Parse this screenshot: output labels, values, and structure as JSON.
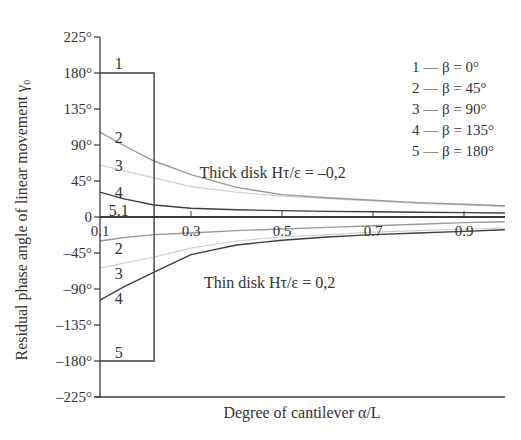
{
  "chart_data": {
    "type": "line",
    "title": "",
    "xlabel": "Degree of cantilever α/L",
    "ylabel": "Residual phase angle of linear movement γ₀",
    "xlim": [
      0.1,
      0.99
    ],
    "ylim": [
      -225,
      225
    ],
    "grid": false,
    "x_ticks": [
      {
        "value": 0.1,
        "label": "0.1"
      },
      {
        "value": 0.3,
        "label": "0.3"
      },
      {
        "value": 0.5,
        "label": "0.5"
      },
      {
        "value": 0.7,
        "label": "0.7"
      },
      {
        "value": 0.9,
        "label": "0.9"
      }
    ],
    "y_ticks": [
      {
        "value": 225,
        "label": "225°"
      },
      {
        "value": 180,
        "label": "180°"
      },
      {
        "value": 135,
        "label": "135°"
      },
      {
        "value": 90,
        "label": "90°"
      },
      {
        "value": 45,
        "label": "45°"
      },
      {
        "value": 0,
        "label": "0"
      },
      {
        "value": -45,
        "label": "–45°"
      },
      {
        "value": -90,
        "label": "–90°"
      },
      {
        "value": -135,
        "label": "–135°"
      },
      {
        "value": -180,
        "label": "–180°"
      },
      {
        "value": -225,
        "label": "–225°"
      }
    ],
    "legend": {
      "position": "top-right",
      "entries": [
        "1 — β = 0°",
        "2 — β = 45°",
        "3 — β = 90°",
        "4 — β = 135°",
        "5 — β = 180°"
      ]
    },
    "annotations": [
      {
        "text": "Thick disk Hτ/ε = –0,2",
        "x": 0.31,
        "y": 55
      },
      {
        "text": "Thin disk Hτ/ε = 0,2",
        "x": 0.32,
        "y": -82
      }
    ],
    "curve_labels": [
      {
        "text": "1",
        "x": 0.15,
        "y": 185
      },
      {
        "text": "2",
        "x": 0.15,
        "y": 93
      },
      {
        "text": "3",
        "x": 0.15,
        "y": 58
      },
      {
        "text": "4",
        "x": 0.15,
        "y": 24
      },
      {
        "text": "5.1",
        "x": 0.15,
        "y": 1
      },
      {
        "text": "2",
        "x": 0.15,
        "y": -46
      },
      {
        "text": "3",
        "x": 0.15,
        "y": -77
      },
      {
        "text": "4",
        "x": 0.15,
        "y": -109
      },
      {
        "text": "5",
        "x": 0.15,
        "y": -176
      }
    ],
    "series": [
      {
        "name": "Thick disk, β = 0°",
        "curve": 1,
        "color": "#3f3f3f",
        "x": [
          0.1,
          0.219,
          0.219,
          0.99
        ],
        "y": [
          180,
          180,
          0,
          0
        ]
      },
      {
        "name": "Thick disk, β = 45°",
        "curve": 2,
        "color": "#9a9a9a",
        "x": [
          0.1,
          0.15,
          0.219,
          0.3,
          0.4,
          0.5,
          0.6,
          0.7,
          0.8,
          0.9,
          0.99
        ],
        "y": [
          106,
          90,
          70,
          53,
          37,
          28,
          24,
          21,
          18,
          16,
          14
        ]
      },
      {
        "name": "Thick disk, β = 90°",
        "curve": 3,
        "color": "#d0d0d0",
        "x": [
          0.1,
          0.15,
          0.219,
          0.3,
          0.4,
          0.5,
          0.6,
          0.7,
          0.8,
          0.9,
          0.99
        ],
        "y": [
          65,
          58,
          49,
          38,
          31,
          26,
          23,
          20,
          17,
          15,
          13
        ]
      },
      {
        "name": "Thick disk, β = 135°",
        "curve": 4,
        "color": "#3f3f3f",
        "x": [
          0.1,
          0.15,
          0.219,
          0.3,
          0.4,
          0.5,
          0.6,
          0.7,
          0.8,
          0.9,
          0.99
        ],
        "y": [
          31,
          23,
          15,
          11,
          9,
          8,
          7,
          6.5,
          6,
          5.5,
          5
        ]
      },
      {
        "name": "Thick disk, β = 180°",
        "curve": 5,
        "color": "#3f3f3f",
        "x": [
          0.1,
          0.99
        ],
        "y": [
          0,
          0
        ]
      },
      {
        "name": "Thin disk, β = 0°",
        "curve": 1,
        "color": "#3f3f3f",
        "x": [
          0.1,
          0.99
        ],
        "y": [
          0,
          0
        ]
      },
      {
        "name": "Thin disk, β = 45°",
        "curve": 2,
        "color": "#9a9a9a",
        "x": [
          0.1,
          0.15,
          0.219,
          0.3,
          0.4,
          0.5,
          0.6,
          0.7,
          0.8,
          0.9,
          0.99
        ],
        "y": [
          -30,
          -26,
          -22,
          -20,
          -17,
          -15,
          -13,
          -11,
          -9,
          -7,
          -6
        ]
      },
      {
        "name": "Thin disk, β = 90°",
        "curve": 3,
        "color": "#d0d0d0",
        "x": [
          0.1,
          0.15,
          0.219,
          0.3,
          0.4,
          0.5,
          0.6,
          0.7,
          0.8,
          0.9,
          0.99
        ],
        "y": [
          -64,
          -58,
          -50,
          -39,
          -30,
          -25,
          -22,
          -19,
          -17,
          -15,
          -14
        ]
      },
      {
        "name": "Thin disk, β = 135°",
        "curve": 4,
        "color": "#3f3f3f",
        "x": [
          0.1,
          0.15,
          0.219,
          0.3,
          0.4,
          0.5,
          0.6,
          0.7,
          0.8,
          0.9,
          0.99
        ],
        "y": [
          -104,
          -88,
          -69,
          -47,
          -35,
          -29,
          -25,
          -22,
          -20,
          -18,
          -16
        ]
      },
      {
        "name": "Thin disk, β = 180°",
        "curve": 5,
        "color": "#3f3f3f",
        "x": [
          0.1,
          0.219,
          0.219,
          0.99
        ],
        "y": [
          -180,
          -180,
          0,
          0
        ]
      }
    ]
  }
}
